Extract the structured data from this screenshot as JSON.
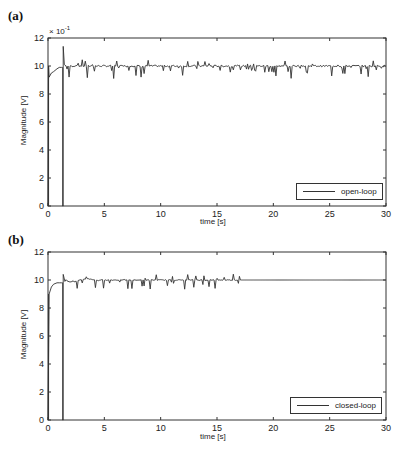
{
  "panels": [
    {
      "label": "(a)",
      "exponent_label": "× 10",
      "exponent_power": "-1",
      "legend": "open-loop",
      "xlabel": "time [s]",
      "ylabel": "Magnitude [V]"
    },
    {
      "label": "(b)",
      "legend": "closed-loop",
      "xlabel": "time [s]",
      "ylabel": "Magnitude [V]"
    }
  ],
  "xticks": [
    "0",
    "5",
    "10",
    "15",
    "20",
    "25",
    "30"
  ],
  "yticks": [
    "0",
    "2",
    "4",
    "6",
    "8",
    "10",
    "12"
  ],
  "chart_data": [
    {
      "type": "line",
      "title": "(a)",
      "xlabel": "time [s]",
      "ylabel": "Magnitude [V]",
      "y_scale_note": "× 10^-1",
      "xlim": [
        0,
        30
      ],
      "ylim": [
        0,
        12
      ],
      "xticks": [
        0,
        5,
        10,
        15,
        20,
        25,
        30
      ],
      "yticks": [
        0,
        2,
        4,
        6,
        8,
        10,
        12
      ],
      "grid": false,
      "legend": {
        "entries": [
          "open-loop"
        ],
        "position": "lower right"
      },
      "series": [
        {
          "name": "open-loop",
          "x": [
            0,
            0.05,
            0.1,
            0.3,
            0.5,
            0.8,
            1.0,
            1.2,
            1.3,
            1.3,
            1.35,
            1.35,
            1.45,
            1.6,
            2,
            3,
            4,
            5,
            6,
            10,
            15,
            20,
            25,
            30
          ],
          "y": [
            0,
            10,
            9.2,
            9.5,
            9.6,
            9.8,
            9.9,
            9.9,
            9.9,
            0,
            0,
            11.4,
            10.1,
            10.0,
            10.0,
            9.9,
            10.0,
            9.9,
            10.0,
            9.9,
            10.0,
            9.9,
            10.0,
            10.0
          ]
        }
      ]
    },
    {
      "type": "line",
      "title": "(b)",
      "xlabel": "time [s]",
      "ylabel": "Magnitude [V]",
      "xlim": [
        0,
        30
      ],
      "ylim": [
        0,
        12
      ],
      "xticks": [
        0,
        5,
        10,
        15,
        20,
        25,
        30
      ],
      "yticks": [
        0,
        2,
        4,
        6,
        8,
        10,
        12
      ],
      "grid": false,
      "legend": {
        "entries": [
          "closed-loop"
        ],
        "position": "lower right"
      },
      "series": [
        {
          "name": "closed-loop",
          "x": [
            0,
            0.05,
            0.1,
            0.3,
            0.5,
            0.8,
            1.0,
            1.2,
            1.3,
            1.3,
            1.35,
            1.35,
            1.5,
            2,
            2.5,
            3,
            3.5,
            4,
            5,
            10,
            15,
            17,
            20,
            25,
            30
          ],
          "y": [
            0,
            4.3,
            9.0,
            9.5,
            9.7,
            9.8,
            9.8,
            9.8,
            9.8,
            0,
            0,
            10.4,
            9.9,
            10.0,
            9.7,
            10.0,
            9.8,
            9.95,
            9.95,
            9.9,
            10.0,
            10.0,
            10.0,
            10.0,
            10.0
          ]
        }
      ]
    }
  ]
}
